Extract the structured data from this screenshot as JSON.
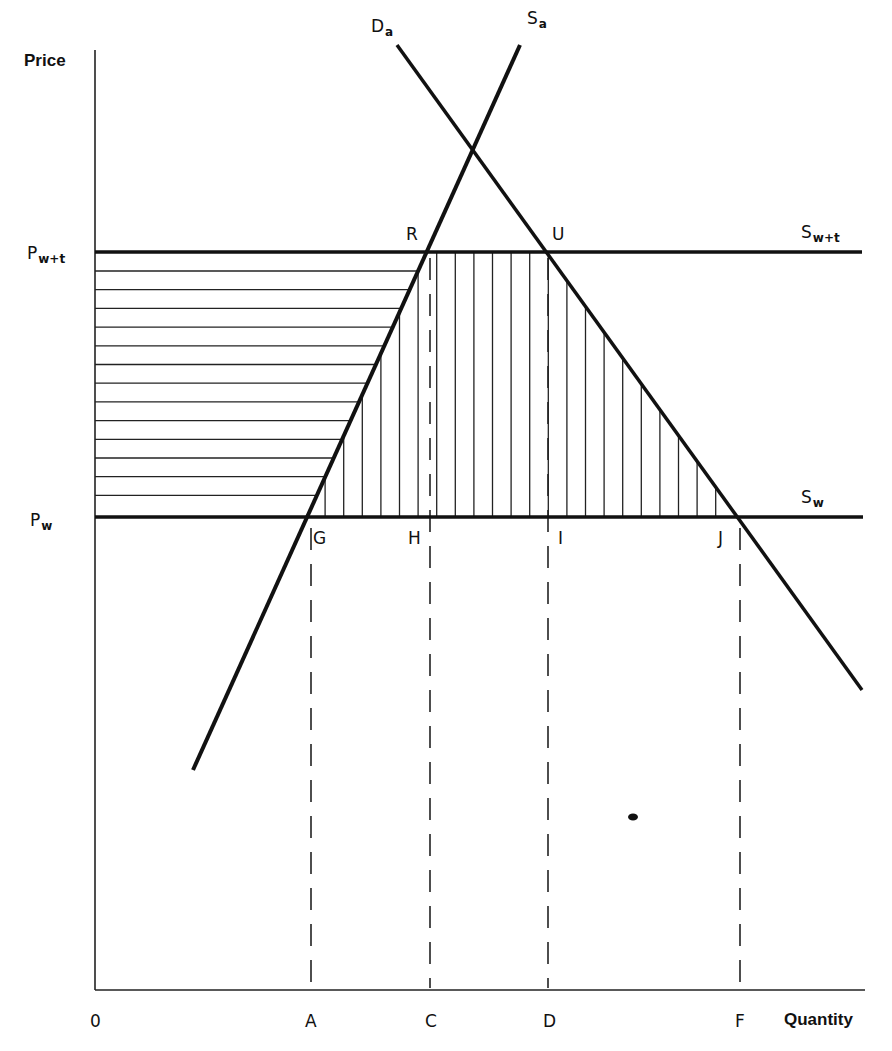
{
  "chart_data": {
    "type": "diagram",
    "title": "",
    "xlabel": "Quantity",
    "ylabel": "Price",
    "axis_origin_label": "0",
    "price_levels": [
      {
        "id": "p_w_t",
        "label_main": "P",
        "label_sub": "w+t",
        "y_px": 252
      },
      {
        "id": "p_w",
        "label_main": "P",
        "label_sub": "w",
        "y_px": 517
      }
    ],
    "curves": [
      {
        "id": "Da",
        "label_main": "D",
        "label_sub": "a",
        "kind": "demand",
        "from_px": [
          397,
          45
        ],
        "to_px": [
          862,
          690
        ]
      },
      {
        "id": "Sa",
        "label_main": "S",
        "label_sub": "a",
        "kind": "supply",
        "from_px": [
          193,
          770
        ],
        "to_px": [
          520,
          45
        ]
      },
      {
        "id": "Swt",
        "label_main": "S",
        "label_sub": "w+t",
        "kind": "horizontal supply",
        "from_px": [
          95,
          252
        ],
        "to_px": [
          862,
          252
        ]
      },
      {
        "id": "Sw",
        "label_main": "S",
        "label_sub": "w",
        "kind": "horizontal supply",
        "from_px": [
          95,
          517
        ],
        "to_px": [
          863,
          517
        ]
      }
    ],
    "points": [
      {
        "label": "R",
        "x_px": 428,
        "y_px": 252
      },
      {
        "label": "U",
        "x_px": 545,
        "y_px": 252
      },
      {
        "label": "G",
        "x_px": 307,
        "y_px": 517
      },
      {
        "label": "H",
        "x_px": 430,
        "y_px": 517
      },
      {
        "label": "I",
        "x_px": 548,
        "y_px": 517
      },
      {
        "label": "J",
        "x_px": 737,
        "y_px": 517
      }
    ],
    "x_ticks": [
      {
        "label": "A",
        "x_px": 311
      },
      {
        "label": "C",
        "x_px": 430
      },
      {
        "label": "D",
        "x_px": 548
      },
      {
        "label": "F",
        "x_px": 740
      }
    ],
    "shaded_regions": [
      {
        "pattern": "horizontal hatching",
        "description": "Between Pw and Pw+t, left of supply curve Sa (producer surplus gain)"
      },
      {
        "pattern": "vertical hatching",
        "description": "Between Pw and Pw+t, right of Sa and left of Da"
      }
    ],
    "grid": false,
    "legend": null
  },
  "labels": {
    "price": "Price",
    "quantity": "Quantity",
    "origin": "0",
    "Da_main": "D",
    "Da_sub": "a",
    "Sa_main": "S",
    "Sa_sub": "a",
    "Swt_main": "S",
    "Swt_sub": "w+t",
    "Sw_main": "S",
    "Sw_sub": "w",
    "Pwt_main": "P",
    "Pwt_sub": "w+t",
    "Pw_main": "P",
    "Pw_sub": "w",
    "R": "R",
    "U": "U",
    "G": "G",
    "H": "H",
    "I": "I",
    "J": "J",
    "A": "A",
    "C": "C",
    "D": "D",
    "F": "F"
  }
}
